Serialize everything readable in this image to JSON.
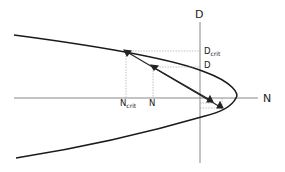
{
  "diagram": {
    "axes": {
      "vertical_label": "D",
      "horizontal_label": "N"
    },
    "labels": {
      "d_crit_main": "D",
      "d_crit_sub": "crit",
      "d_value": "D",
      "n_crit_main": "N",
      "n_crit_sub": "crit",
      "n_value": "N"
    },
    "colors": {
      "curve": "#1a1a1a",
      "axis": "#7a7a7a",
      "guide": "#9a9a9a",
      "arrow": "#222222"
    }
  }
}
